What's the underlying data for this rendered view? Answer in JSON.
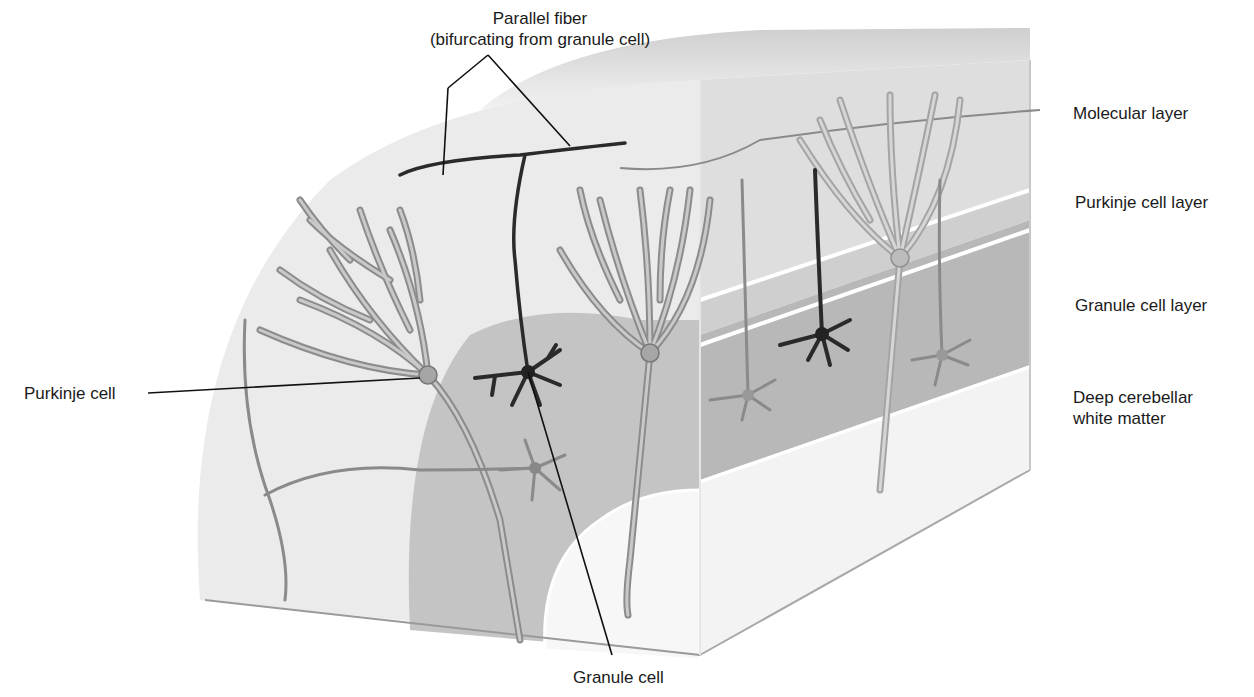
{
  "figure": {
    "colors": {
      "background": "#ffffff",
      "molecular_layer": "#ececec",
      "purkinje_layer": "#d8d8d8",
      "granule_layer": "#bdbdbd",
      "white_matter": "#f4f4f4",
      "purkinje_cell": "#8e8e8e",
      "granule_cell": "#2a2a2a",
      "leader_line": "#111111"
    }
  },
  "labels": {
    "parallel_fiber": {
      "line1": "Parallel fiber",
      "line2": "(bifurcating from granule cell)"
    },
    "purkinje_cell": "Purkinje cell",
    "granule_cell": "Granule cell",
    "layers": [
      {
        "name": "Molecular layer"
      },
      {
        "name": "Purkinje cell layer"
      },
      {
        "name": "Granule cell layer"
      },
      {
        "name": "Deep cerebellar",
        "name_line2": "white matter"
      }
    ]
  }
}
